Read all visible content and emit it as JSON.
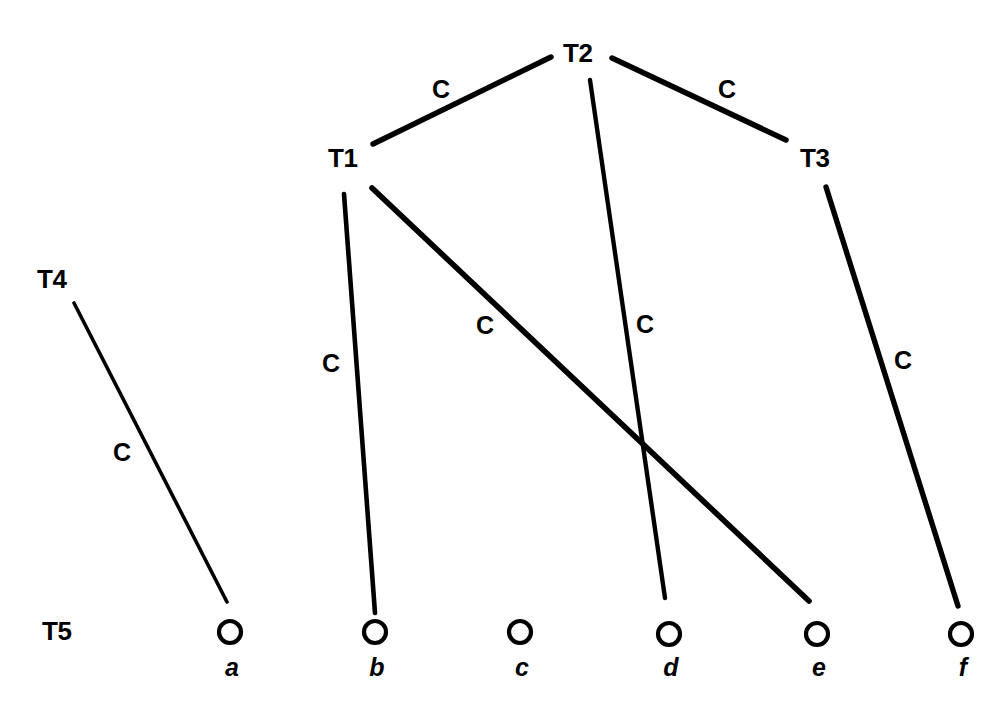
{
  "figure": {
    "type": "tree-diagram",
    "background_color": "#ffffff",
    "ink_color": "#000000",
    "width": 1008,
    "height": 719
  },
  "levels": [
    {
      "id": "T1",
      "label": "T1",
      "x": 328,
      "y": 167
    },
    {
      "id": "T2",
      "label": "T2",
      "x": 563,
      "y": 62
    },
    {
      "id": "T3",
      "label": "T3",
      "x": 800,
      "y": 167
    },
    {
      "id": "T4",
      "label": "T4",
      "x": 37,
      "y": 288
    },
    {
      "id": "T5",
      "label": "T5",
      "x": 42,
      "y": 640
    }
  ],
  "leaves": [
    {
      "id": "a",
      "label": "a",
      "cx": 230,
      "cy": 632,
      "r": 11
    },
    {
      "id": "b",
      "label": "b",
      "cx": 375,
      "cy": 632,
      "r": 11
    },
    {
      "id": "c",
      "label": "c",
      "cx": 520,
      "cy": 632,
      "r": 11
    },
    {
      "id": "d",
      "label": "d",
      "cx": 669,
      "cy": 634,
      "r": 11
    },
    {
      "id": "e",
      "label": "e",
      "cx": 817,
      "cy": 634,
      "r": 11
    },
    {
      "id": "f",
      "label": "f",
      "cx": 961,
      "cy": 634,
      "r": 11
    }
  ],
  "leaf_label_y": 676,
  "edges": [
    {
      "id": "T1-T2",
      "from": "T1",
      "to": "T2",
      "label": "C",
      "x1": 373,
      "y1": 144,
      "x2": 551,
      "y2": 57,
      "width": 5.5,
      "label_x": 441,
      "label_y": 98
    },
    {
      "id": "T2-T3",
      "from": "T2",
      "to": "T3",
      "label": "C",
      "x1": 612,
      "y1": 58,
      "x2": 786,
      "y2": 140,
      "width": 5.5,
      "label_x": 727,
      "label_y": 98
    },
    {
      "id": "T1-b",
      "from": "T1",
      "to": "b",
      "label": "C",
      "x1": 344,
      "y1": 194,
      "x2": 375,
      "y2": 613,
      "width": 4.6,
      "label_x": 331,
      "label_y": 372
    },
    {
      "id": "T1-e",
      "from": "T1",
      "to": "e",
      "label": "C",
      "x1": 372,
      "y1": 188,
      "x2": 809,
      "y2": 601,
      "width": 5.6,
      "label_x": 485,
      "label_y": 334
    },
    {
      "id": "T2-d",
      "from": "T2",
      "to": "d",
      "label": "C",
      "x1": 590,
      "y1": 80,
      "x2": 665,
      "y2": 598,
      "width": 4.4,
      "label_x": 645,
      "label_y": 333
    },
    {
      "id": "T3-f",
      "from": "T3",
      "to": "f",
      "label": "C",
      "x1": 826,
      "y1": 187,
      "x2": 958,
      "y2": 606,
      "width": 5.4,
      "label_x": 903,
      "label_y": 369
    },
    {
      "id": "T4-a",
      "from": "T4",
      "to": "a",
      "label": "C",
      "x1": 74,
      "y1": 303,
      "x2": 227,
      "y2": 602,
      "width": 3.6,
      "label_x": 122,
      "label_y": 461
    }
  ]
}
